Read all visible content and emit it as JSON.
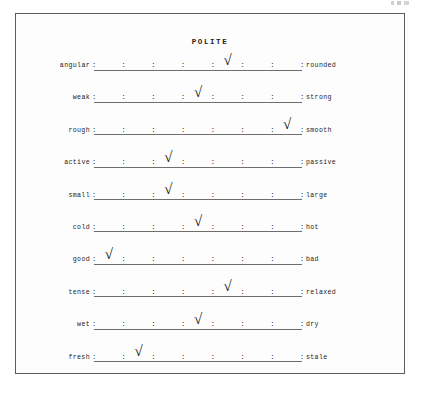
{
  "page": {
    "title": "POLITE",
    "artifact_label": ""
  },
  "scale": {
    "tick_glyph": ":",
    "check_glyph": "√",
    "slot_count": 7,
    "tick_count": 8,
    "rows": [
      {
        "left": "angular",
        "right": "rounded",
        "checked_slot": 5
      },
      {
        "left": "weak",
        "right": "strong",
        "checked_slot": 4
      },
      {
        "left": "rough",
        "right": "smooth",
        "checked_slot": 7
      },
      {
        "left": "active",
        "right": "passive",
        "checked_slot": 3
      },
      {
        "left": "small",
        "right": "large",
        "checked_slot": 3
      },
      {
        "left": "cold",
        "right": "hot",
        "checked_slot": 4
      },
      {
        "left": "good",
        "right": "bad",
        "checked_slot": 1
      },
      {
        "left": "tense",
        "right": "relaxed",
        "checked_slot": 5
      },
      {
        "left": "wet",
        "right": "dry",
        "checked_slot": 4
      },
      {
        "left": "fresh",
        "right": "stale",
        "checked_slot": 2
      }
    ]
  },
  "colors": {
    "ink": "#1d1d1d",
    "rule": "#6f6f6f",
    "border": "#5c5c5c",
    "paper": "#fdfdfd"
  }
}
